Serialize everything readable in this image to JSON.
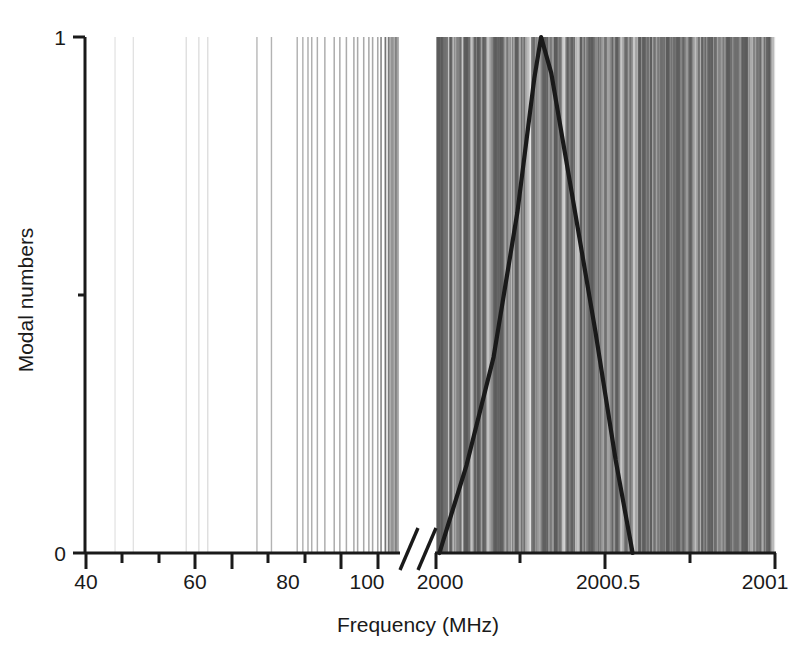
{
  "chart_data": {
    "type": "bar",
    "title": "",
    "subtitle": "",
    "xlabel": "Frequency (MHz)",
    "ylabel": "Modal numbers",
    "grid": false,
    "legend": null,
    "annotations": [
      {
        "name": "axis-break",
        "description": "double-slash break between low-frequency panel and 2000 MHz panel"
      }
    ],
    "axes": {
      "y": {
        "label": "Modal numbers",
        "ticks": [
          0,
          1
        ],
        "tick_labels": [
          "0",
          "1"
        ],
        "minor_ticks": [
          0.5
        ],
        "ylim": [
          0,
          1
        ]
      },
      "x_left_panel": {
        "ticks": [
          40,
          60,
          80,
          100
        ],
        "tick_labels": [
          "40",
          "60",
          "80",
          "100"
        ],
        "minor_ticks": [
          50,
          70,
          90,
          110
        ],
        "xlim": [
          40,
          118
        ],
        "units": "MHz"
      },
      "x_right_panel": {
        "ticks": [
          2000,
          2000.5,
          2001
        ],
        "tick_labels": [
          "2000",
          "2000.5",
          "2001"
        ],
        "minor_ticks": [
          2000.25,
          2000.75
        ],
        "xlim": [
          2000,
          2001
        ],
        "units": "MHz"
      }
    },
    "series": [
      {
        "name": "Modal lines (low frequency panel)",
        "type": "bar",
        "style": "vertical spectral lines, height 1",
        "x": [
          46.2,
          50.1,
          61.4,
          64.1,
          66.0,
          76.5,
          79.6,
          85.1,
          86.3,
          87.4,
          88.2,
          89.4,
          91.0,
          93.0,
          94.2,
          95.6,
          97.2,
          98.0,
          99.3,
          100.4,
          101.2,
          102.3,
          103.0,
          103.9,
          104.6,
          105.4,
          106.2,
          107.0,
          107.8,
          108.4,
          109.0,
          109.6,
          110.2,
          110.9,
          111.5,
          112.0,
          112.6,
          113.1,
          113.7,
          114.2,
          114.8,
          115.3,
          115.9,
          116.4
        ],
        "values": [
          1,
          1,
          1,
          1,
          1,
          1,
          1,
          1,
          1,
          1,
          1,
          1,
          1,
          1,
          1,
          1,
          1,
          1,
          1,
          1,
          1,
          1,
          1,
          1,
          1,
          1,
          1,
          1,
          1,
          1,
          1,
          1,
          1,
          1,
          1,
          1,
          1,
          1,
          1,
          1,
          1,
          1,
          1,
          1
        ]
      },
      {
        "name": "Modal lines (2000 MHz panel)",
        "type": "bar",
        "style": "dense vertical spectral lines, height 1",
        "description": "quasi-continuous dense comb of modes spanning 2000 to 2001 MHz"
      },
      {
        "name": "Gain profile",
        "type": "line",
        "style": "thick black triangular peak",
        "peak_x": 2000.31,
        "peak_y": 1.0,
        "left_foot_x": 2000.01,
        "right_foot_x": 2000.58,
        "points_x": [
          2000.01,
          2000.09,
          2000.17,
          2000.24,
          2000.29,
          2000.31,
          2000.34,
          2000.4,
          2000.47,
          2000.53,
          2000.58
        ],
        "points_y": [
          0.0,
          0.17,
          0.38,
          0.66,
          0.92,
          1.0,
          0.93,
          0.7,
          0.43,
          0.18,
          0.0
        ]
      }
    ]
  },
  "labels": {
    "y_title": "Modal numbers",
    "x_title": "Frequency (MHz)",
    "y_tick_0": "0",
    "y_tick_1": "1",
    "x_tick_40": "40",
    "x_tick_60": "60",
    "x_tick_80": "80",
    "x_tick_100": "100",
    "x_tick_2000": "2000",
    "x_tick_2000_5": "2000.5",
    "x_tick_2001": "2001"
  },
  "colors": {
    "axis": "#1a1a1a",
    "text": "#1a1a1a",
    "curve": "#1a1a1a",
    "background": "#ffffff",
    "line_light": "#c8c8c8",
    "line_mid": "#9a9a9a",
    "line_dark": "#6e6e6e"
  }
}
